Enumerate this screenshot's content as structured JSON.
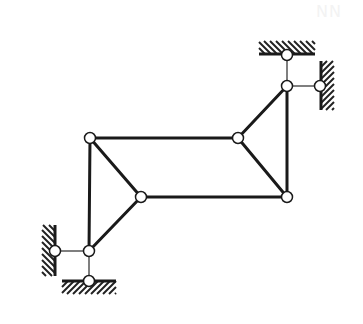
{
  "diagram": {
    "type": "planar linkage / truss with fixed supports",
    "colors": {
      "bar": "#1a1a1a",
      "thin_link": "#555555",
      "node_fill": "#ffffff",
      "hatch": "#222222"
    },
    "watermark": "NN",
    "nodes": [
      {
        "id": "A",
        "x": 90,
        "y": 138
      },
      {
        "id": "B",
        "x": 238,
        "y": 138
      },
      {
        "id": "C",
        "x": 141,
        "y": 197
      },
      {
        "id": "D",
        "x": 287,
        "y": 197
      },
      {
        "id": "E",
        "x": 89,
        "y": 251
      },
      {
        "id": "F",
        "x": 55,
        "y": 251
      },
      {
        "id": "G",
        "x": 89,
        "y": 281
      },
      {
        "id": "H",
        "x": 287,
        "y": 86
      },
      {
        "id": "I",
        "x": 320,
        "y": 86
      },
      {
        "id": "J",
        "x": 287,
        "y": 55
      }
    ],
    "bars": [
      {
        "from": "A",
        "to": "B",
        "thick": true
      },
      {
        "from": "C",
        "to": "D",
        "thick": true
      },
      {
        "from": "A",
        "to": "C",
        "thick": true
      },
      {
        "from": "A",
        "to": "E",
        "thick": true
      },
      {
        "from": "C",
        "to": "E",
        "thick": true
      },
      {
        "from": "B",
        "to": "D",
        "thick": true
      },
      {
        "from": "B",
        "to": "H",
        "thick": true
      },
      {
        "from": "D",
        "to": "H",
        "thick": true
      },
      {
        "from": "E",
        "to": "F",
        "thick": false
      },
      {
        "from": "E",
        "to": "G",
        "thick": false
      },
      {
        "from": "H",
        "to": "I",
        "thick": false
      },
      {
        "from": "H",
        "to": "J",
        "thick": false
      }
    ],
    "supports": [
      {
        "id": "wall-left",
        "orientation": "vertical",
        "x": 55,
        "y1": 225,
        "y2": 276,
        "hatch_side": "left"
      },
      {
        "id": "ground-bottom",
        "orientation": "horizontal",
        "y": 281,
        "x1": 62,
        "x2": 116,
        "hatch_side": "below"
      },
      {
        "id": "ground-top",
        "orientation": "horizontal",
        "y": 54,
        "x1": 259,
        "x2": 315,
        "hatch_side": "above"
      },
      {
        "id": "wall-right",
        "orientation": "vertical",
        "x": 321,
        "y1": 61,
        "y2": 110,
        "hatch_side": "right"
      }
    ]
  }
}
